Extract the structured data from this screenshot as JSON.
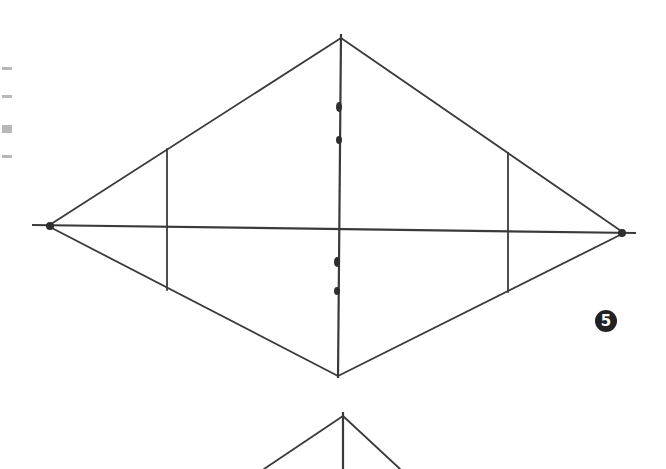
{
  "figure": {
    "step_number": "5",
    "colors": {
      "stroke": "#3a3a3a",
      "dot": "#2e2e2e",
      "badge_bg": "#222222",
      "badge_fg": "#ffffff"
    },
    "rhombus": {
      "top": [
        341,
        38
      ],
      "right": [
        624,
        233
      ],
      "bottom": [
        338,
        376
      ],
      "left": [
        48,
        226
      ]
    },
    "horizontal_axis": {
      "from": [
        32,
        225
      ],
      "to": [
        636,
        233
      ]
    },
    "vertical_axis": {
      "from": [
        341,
        38
      ],
      "to": [
        338,
        376
      ]
    },
    "vertical_chords": [
      {
        "x": 167,
        "y_top": 149,
        "y_bottom": 290
      },
      {
        "x": 508,
        "y_top": 153,
        "y_bottom": 292
      }
    ],
    "axis_dots": [
      [
        339,
        107
      ],
      [
        339,
        140
      ],
      [
        337,
        262
      ],
      [
        337,
        291
      ]
    ],
    "next_figure_partial": {
      "apex": [
        343,
        416
      ],
      "left_end": [
        264,
        469
      ],
      "right_end": [
        400,
        469
      ]
    }
  }
}
